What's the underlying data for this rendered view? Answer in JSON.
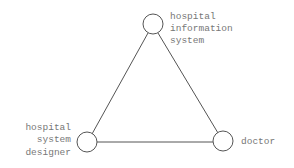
{
  "diagram": {
    "type": "triangle-relationship",
    "nodes": [
      {
        "id": "his",
        "label_lines": [
          "hospital",
          "information",
          "system"
        ]
      },
      {
        "id": "designer",
        "label_lines": [
          "hospital",
          "system",
          "designer"
        ]
      },
      {
        "id": "doctor",
        "label_lines": [
          "doctor"
        ]
      }
    ],
    "edges": [
      {
        "from": "his",
        "to": "designer"
      },
      {
        "from": "his",
        "to": "doctor"
      },
      {
        "from": "designer",
        "to": "doctor"
      }
    ]
  }
}
